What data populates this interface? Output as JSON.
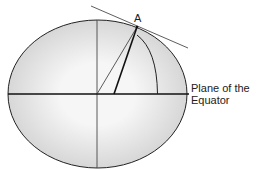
{
  "diagram": {
    "point_label": "A",
    "equator_label_line1": "Plane of the",
    "equator_label_line2": "Equator",
    "colors": {
      "stroke": "#222222",
      "fill_light": "#f4f4f4",
      "fill_dark": "#cfcfcf"
    }
  }
}
